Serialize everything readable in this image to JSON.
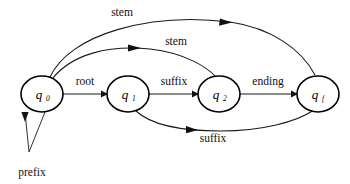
{
  "diagram": {
    "kind": "finite-state-automaton",
    "width": 350,
    "height": 184,
    "background_color": "#ffffff",
    "stroke_color": "#111111",
    "nodes": [
      {
        "id": "q0",
        "base": "q",
        "sub": "0",
        "cx": 42,
        "cy": 94,
        "rx": 21,
        "ry": 18
      },
      {
        "id": "q1",
        "base": "q",
        "sub": "1",
        "cx": 128,
        "cy": 94,
        "rx": 21,
        "ry": 18
      },
      {
        "id": "q2",
        "base": "q",
        "sub": "2",
        "cx": 219,
        "cy": 94,
        "rx": 21,
        "ry": 18
      },
      {
        "id": "qf",
        "base": "q",
        "sub": "f",
        "cx": 318,
        "cy": 94,
        "rx": 21,
        "ry": 18
      }
    ],
    "edges": [
      {
        "id": "e-root",
        "label": "root",
        "from": "q0",
        "to": "q1",
        "label_x": 85,
        "label_y": 85
      },
      {
        "id": "e-suffix-mid",
        "label": "suffix",
        "from": "q1",
        "to": "q2",
        "label_x": 174,
        "label_y": 85
      },
      {
        "id": "e-ending",
        "label": "ending",
        "from": "q2",
        "to": "qf",
        "label_x": 268,
        "label_y": 85
      },
      {
        "id": "e-stem-top",
        "label": "stem",
        "from": "q0",
        "to": "qf",
        "label_x": 122,
        "label_y": 16
      },
      {
        "id": "e-stem-inner",
        "label": "stem",
        "from": "q0",
        "to": "q2",
        "label_x": 176,
        "label_y": 45
      },
      {
        "id": "e-suffix-bot",
        "label": "suffix",
        "from": "q1",
        "to": "qf",
        "label_x": 213,
        "label_y": 142
      },
      {
        "id": "e-prefix",
        "label": "prefix",
        "from": "start",
        "to": "q0",
        "label_x": 32,
        "label_y": 176
      }
    ]
  }
}
